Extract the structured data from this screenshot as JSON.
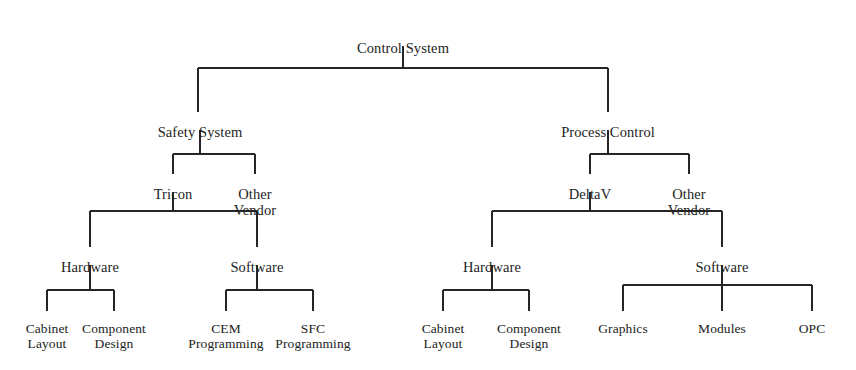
{
  "diagram": {
    "kind": "org-tree",
    "title": "Control System",
    "orientation": "top-down",
    "canvas": {
      "width": 856,
      "height": 370
    },
    "style": {
      "line_color": "#262626",
      "text_color": "#232323",
      "background": "#ffffff",
      "line_width": 2
    },
    "nodes": [
      {
        "id": "control-system",
        "label": "Control System",
        "level": 0,
        "x": 403,
        "y": 40,
        "class": "lvl-root"
      },
      {
        "id": "safety-system",
        "label": "Safety System",
        "level": 1,
        "x": 200,
        "y": 124,
        "class": "lvl-one"
      },
      {
        "id": "process-control",
        "label": "Process Control",
        "level": 1,
        "x": 608,
        "y": 124,
        "class": "lvl-one"
      },
      {
        "id": "tricon",
        "label": "Tricon",
        "level": 2,
        "x": 173,
        "y": 186,
        "class": "lvl-two"
      },
      {
        "id": "safety-other-vendor",
        "label": "Other\nVendor",
        "level": 2,
        "x": 255,
        "y": 186,
        "class": "lvl-two"
      },
      {
        "id": "deltav",
        "label": "DeltaV",
        "level": 2,
        "x": 590,
        "y": 186,
        "class": "lvl-two"
      },
      {
        "id": "process-other-vendor",
        "label": "Other\nVendor",
        "level": 2,
        "x": 689,
        "y": 186,
        "class": "lvl-two"
      },
      {
        "id": "tricon-hardware",
        "label": "Hardware",
        "level": 3,
        "x": 90,
        "y": 259,
        "class": "lvl-three"
      },
      {
        "id": "tricon-software",
        "label": "Software",
        "level": 3,
        "x": 257,
        "y": 259,
        "class": "lvl-three"
      },
      {
        "id": "deltav-hardware",
        "label": "Hardware",
        "level": 3,
        "x": 492,
        "y": 259,
        "class": "lvl-three"
      },
      {
        "id": "deltav-software",
        "label": "Software",
        "level": 3,
        "x": 722,
        "y": 259,
        "class": "lvl-three"
      },
      {
        "id": "tricon-cabinet-layout",
        "label": "Cabinet\nLayout",
        "level": 4,
        "x": 47,
        "y": 321,
        "class": "lvl-leaf"
      },
      {
        "id": "tricon-component-design",
        "label": "Component\nDesign",
        "level": 4,
        "x": 114,
        "y": 321,
        "class": "lvl-leaf"
      },
      {
        "id": "cem-programming",
        "label": "CEM\nProgramming",
        "level": 4,
        "x": 226,
        "y": 321,
        "class": "lvl-leaf"
      },
      {
        "id": "sfc-programming",
        "label": "SFC\nProgramming",
        "level": 4,
        "x": 313,
        "y": 321,
        "class": "lvl-leaf"
      },
      {
        "id": "deltav-cabinet-layout",
        "label": "Cabinet\nLayout",
        "level": 4,
        "x": 443,
        "y": 321,
        "class": "lvl-leaf"
      },
      {
        "id": "deltav-component-design",
        "label": "Component\nDesign",
        "level": 4,
        "x": 529,
        "y": 321,
        "class": "lvl-leaf"
      },
      {
        "id": "graphics",
        "label": "Graphics",
        "level": 4,
        "x": 623,
        "y": 321,
        "class": "lvl-leaf"
      },
      {
        "id": "modules",
        "label": "Modules",
        "level": 4,
        "x": 722,
        "y": 321,
        "class": "lvl-leaf"
      },
      {
        "id": "opc",
        "label": "OPC",
        "level": 4,
        "x": 812,
        "y": 321,
        "class": "lvl-leaf"
      }
    ],
    "edges": [
      {
        "from": "control-system",
        "to": "safety-system"
      },
      {
        "from": "control-system",
        "to": "process-control"
      },
      {
        "from": "safety-system",
        "to": "tricon"
      },
      {
        "from": "safety-system",
        "to": "safety-other-vendor"
      },
      {
        "from": "process-control",
        "to": "deltav"
      },
      {
        "from": "process-control",
        "to": "process-other-vendor"
      },
      {
        "from": "tricon",
        "to": "tricon-hardware"
      },
      {
        "from": "tricon",
        "to": "tricon-software"
      },
      {
        "from": "deltav",
        "to": "deltav-hardware"
      },
      {
        "from": "deltav",
        "to": "deltav-software"
      },
      {
        "from": "tricon-hardware",
        "to": "tricon-cabinet-layout"
      },
      {
        "from": "tricon-hardware",
        "to": "tricon-component-design"
      },
      {
        "from": "tricon-software",
        "to": "cem-programming"
      },
      {
        "from": "tricon-software",
        "to": "sfc-programming"
      },
      {
        "from": "deltav-hardware",
        "to": "deltav-cabinet-layout"
      },
      {
        "from": "deltav-hardware",
        "to": "deltav-component-design"
      },
      {
        "from": "deltav-software",
        "to": "graphics"
      },
      {
        "from": "deltav-software",
        "to": "modules"
      },
      {
        "from": "deltav-software",
        "to": "opc"
      }
    ],
    "connectors": [
      {
        "id": "root-split",
        "stem_x": 403,
        "stem_top": 46,
        "bar_y": 68,
        "bar_x1": 198,
        "bar_x2": 608,
        "drops": [
          198,
          608
        ],
        "drop_bottom": 112
      },
      {
        "id": "safety-split",
        "stem_x": 200,
        "stem_top": 130,
        "bar_y": 154,
        "bar_x1": 173,
        "bar_x2": 255,
        "drops": [
          173,
          255
        ],
        "drop_bottom": 174
      },
      {
        "id": "process-split",
        "stem_x": 608,
        "stem_top": 130,
        "bar_y": 154,
        "bar_x1": 590,
        "bar_x2": 689,
        "drops": [
          590,
          689
        ],
        "drop_bottom": 174
      },
      {
        "id": "tricon-split",
        "stem_x": 173,
        "stem_top": 192,
        "bar_y": 211,
        "bar_x1": 90,
        "bar_x2": 257,
        "drops": [
          90,
          257
        ],
        "drop_bottom": 247
      },
      {
        "id": "deltav-split",
        "stem_x": 590,
        "stem_top": 192,
        "bar_y": 211,
        "bar_x1": 492,
        "bar_x2": 722,
        "drops": [
          492,
          722
        ],
        "drop_bottom": 247
      },
      {
        "id": "tricon-hardware-split",
        "stem_x": 90,
        "stem_top": 265,
        "bar_y": 290,
        "bar_x1": 47,
        "bar_x2": 114,
        "drops": [
          47,
          114
        ],
        "drop_bottom": 311
      },
      {
        "id": "tricon-software-split",
        "stem_x": 257,
        "stem_top": 265,
        "bar_y": 290,
        "bar_x1": 226,
        "bar_x2": 313,
        "drops": [
          226,
          313
        ],
        "drop_bottom": 311
      },
      {
        "id": "deltav-hardware-split",
        "stem_x": 492,
        "stem_top": 265,
        "bar_y": 290,
        "bar_x1": 443,
        "bar_x2": 529,
        "drops": [
          443,
          529
        ],
        "drop_bottom": 311
      },
      {
        "id": "deltav-software-split",
        "stem_x": 722,
        "stem_top": 265,
        "bar_y": 285,
        "bar_x1": 623,
        "bar_x2": 812,
        "drops": [
          623,
          722,
          812
        ],
        "drop_bottom": 311
      }
    ]
  }
}
